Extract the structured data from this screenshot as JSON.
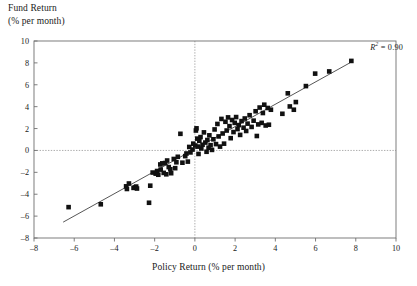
{
  "figure": {
    "ylabel_lines": [
      "Fund Return",
      "(% per month)"
    ],
    "xlabel": "Policy Return (% per month)",
    "annotation_r": "R",
    "annotation_sup": "2",
    "annotation_value": " = 0.90"
  },
  "chart_data": {
    "type": "scatter",
    "title": "",
    "xlabel": "Policy Return (% per month)",
    "ylabel": "Fund Return (% per month)",
    "xlim": [
      -8,
      10
    ],
    "ylim": [
      -8,
      10
    ],
    "xticks": [
      -8,
      -6,
      -4,
      -2,
      0,
      2,
      4,
      6,
      8,
      10
    ],
    "yticks": [
      -8,
      -6,
      -4,
      -2,
      0,
      2,
      4,
      6,
      8,
      10
    ],
    "xtick_labels": [
      "–8",
      "–6",
      "–4",
      "–2",
      "0",
      "2",
      "4",
      "6",
      "8",
      "10"
    ],
    "ytick_labels": [
      "–8",
      "–6",
      "–4",
      "–2",
      "0",
      "2",
      "4",
      "6",
      "8",
      "10"
    ],
    "grid": false,
    "zero_lines": {
      "x": 0,
      "y": 0,
      "style": "dotted",
      "color": "#8a8a8a"
    },
    "legend": null,
    "annotations": [
      {
        "text": "R2 = 0.90",
        "x": 7.6,
        "y": 9.2,
        "align": "right"
      }
    ],
    "marker": {
      "shape": "square",
      "color": "#111111",
      "size_px": 4.6
    },
    "trendline": {
      "type": "linear",
      "x_start": -6.55,
      "y_start": -6.55,
      "x_end": 7.85,
      "y_end": 8.15,
      "slope": 1.022,
      "intercept": 0.14,
      "color": "#2b2b2b",
      "width_px": 0.8
    },
    "r_squared": 0.9,
    "n_points": 104,
    "points": [
      [
        -6.28,
        -5.18
      ],
      [
        -4.68,
        -4.92
      ],
      [
        -3.42,
        -3.28
      ],
      [
        -3.38,
        -3.52
      ],
      [
        -3.28,
        -3.02
      ],
      [
        -3.05,
        -3.42
      ],
      [
        -2.98,
        -3.38
      ],
      [
        -2.92,
        -3.3
      ],
      [
        -2.88,
        -3.48
      ],
      [
        -2.28,
        -4.78
      ],
      [
        -2.22,
        -3.22
      ],
      [
        -2.1,
        -2.02
      ],
      [
        -1.95,
        -2.12
      ],
      [
        -1.88,
        -1.88
      ],
      [
        -1.82,
        -2.22
      ],
      [
        -1.72,
        -1.28
      ],
      [
        -1.7,
        -1.75
      ],
      [
        -1.62,
        -1.18
      ],
      [
        -1.55,
        -2.05
      ],
      [
        -1.48,
        -1.15
      ],
      [
        -1.42,
        -2.18
      ],
      [
        -1.38,
        -0.92
      ],
      [
        -1.3,
        -1.52
      ],
      [
        -1.22,
        -1.72
      ],
      [
        -1.18,
        -2.08
      ],
      [
        -1.05,
        -0.78
      ],
      [
        -0.98,
        -1.62
      ],
      [
        -0.92,
        -1.08
      ],
      [
        -0.85,
        -0.58
      ],
      [
        -0.72,
        1.52
      ],
      [
        -0.62,
        -1.12
      ],
      [
        -0.48,
        -0.52
      ],
      [
        -0.42,
        -0.28
      ],
      [
        -0.35,
        -1.02
      ],
      [
        -0.28,
        0.32
      ],
      [
        -0.22,
        -0.18
      ],
      [
        -0.12,
        0.08
      ],
      [
        -0.08,
        0.62
      ],
      [
        0.02,
        0.45
      ],
      [
        0.05,
        1.82
      ],
      [
        0.08,
        2.02
      ],
      [
        0.12,
        1.08
      ],
      [
        0.15,
        0.35
      ],
      [
        0.18,
        -0.32
      ],
      [
        0.22,
        0.88
      ],
      [
        0.28,
        1.22
      ],
      [
        0.32,
        0.18
      ],
      [
        0.38,
        0.52
      ],
      [
        0.45,
        1.65
      ],
      [
        0.52,
        0.72
      ],
      [
        0.58,
        -0.12
      ],
      [
        0.62,
        0.95
      ],
      [
        0.68,
        0.25
      ],
      [
        0.72,
        1.38
      ],
      [
        0.78,
        0.48
      ],
      [
        0.85,
        0.05
      ],
      [
        0.92,
        1.02
      ],
      [
        0.98,
        1.92
      ],
      [
        1.05,
        0.58
      ],
      [
        1.12,
        2.42
      ],
      [
        1.18,
        1.28
      ],
      [
        1.25,
        0.35
      ],
      [
        1.32,
        2.88
      ],
      [
        1.38,
        1.55
      ],
      [
        1.45,
        0.62
      ],
      [
        1.52,
        2.62
      ],
      [
        1.58,
        1.82
      ],
      [
        1.65,
        3.02
      ],
      [
        1.72,
        2.22
      ],
      [
        1.78,
        1.12
      ],
      [
        1.85,
        2.78
      ],
      [
        1.92,
        1.68
      ],
      [
        1.98,
        2.52
      ],
      [
        2.05,
        3.05
      ],
      [
        2.12,
        1.95
      ],
      [
        2.18,
        2.32
      ],
      [
        2.25,
        1.42
      ],
      [
        2.32,
        2.68
      ],
      [
        2.42,
        2.08
      ],
      [
        2.48,
        2.92
      ],
      [
        2.55,
        1.78
      ],
      [
        2.62,
        2.45
      ],
      [
        2.72,
        3.22
      ],
      [
        2.82,
        2.15
      ],
      [
        2.92,
        2.72
      ],
      [
        3.02,
        3.58
      ],
      [
        3.08,
        1.32
      ],
      [
        3.15,
        2.38
      ],
      [
        3.22,
        3.92
      ],
      [
        3.32,
        2.52
      ],
      [
        3.38,
        3.42
      ],
      [
        3.45,
        4.18
      ],
      [
        3.52,
        2.28
      ],
      [
        3.62,
        3.88
      ],
      [
        3.68,
        2.35
      ],
      [
        3.78,
        3.72
      ],
      [
        4.35,
        3.35
      ],
      [
        4.62,
        5.22
      ],
      [
        4.72,
        4.02
      ],
      [
        4.92,
        3.72
      ],
      [
        5.02,
        4.42
      ],
      [
        5.52,
        5.88
      ],
      [
        5.98,
        7.02
      ],
      [
        6.68,
        7.22
      ],
      [
        7.78,
        8.18
      ]
    ]
  }
}
